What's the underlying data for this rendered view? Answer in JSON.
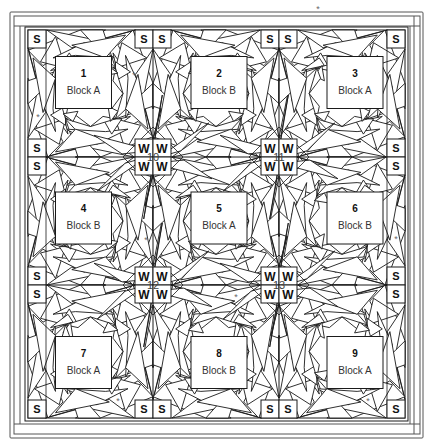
{
  "diagram": {
    "type": "quilt-layout",
    "grid": {
      "rows": 3,
      "cols": 3
    },
    "blocks": [
      {
        "number": "1",
        "name": "Block A"
      },
      {
        "number": "2",
        "name": "Block B"
      },
      {
        "number": "3",
        "name": "Block A"
      },
      {
        "number": "4",
        "name": "Block B"
      },
      {
        "number": "5",
        "name": "Block A"
      },
      {
        "number": "6",
        "name": "Block B"
      },
      {
        "number": "7",
        "name": "Block A"
      },
      {
        "number": "8",
        "name": "Block B"
      },
      {
        "number": "9",
        "name": "Block A"
      }
    ],
    "junctions": [
      {
        "number": "10",
        "cells": [
          "W",
          "W",
          "W",
          "W"
        ]
      },
      {
        "number": "11",
        "cells": [
          "W",
          "W",
          "W",
          "W"
        ]
      },
      {
        "number": "12",
        "cells": [
          "W",
          "W",
          "W",
          "W"
        ]
      },
      {
        "number": "13",
        "cells": [
          "W",
          "W",
          "W",
          "W"
        ]
      }
    ],
    "corner_square_label": "S",
    "marker_symbol": "*",
    "colors": {
      "line": "#1a1a1a",
      "background": "#ffffff",
      "frame": "#555555"
    }
  }
}
